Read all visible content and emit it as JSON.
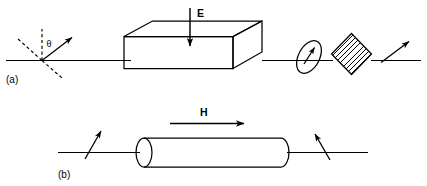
{
  "figure": {
    "width": 427,
    "height": 186,
    "background_color": "#ffffff",
    "line_color": "#000000"
  },
  "panels": [
    {
      "id": "a",
      "label": "(a)",
      "description": "Electro-optic modulator: polarized beam through rectangular crystal slab with transverse electric field E, then analyzer ellipse and hatched polarizer element",
      "field_label": "E",
      "field_direction": "down",
      "angle_label": "θ",
      "element_shape": "rectangular-slab"
    },
    {
      "id": "b",
      "label": "(b)",
      "description": "Magneto-optic Faraday rotator: beam through cylindrical rod with longitudinal magnetic field H, polarization plane rotated at output",
      "field_label": "H",
      "field_direction": "right",
      "element_shape": "cylindrical-rod"
    }
  ],
  "labels": {
    "panel_a": "(a)",
    "panel_b": "(b)",
    "electric_field": "E",
    "magnetic_field": "H",
    "theta": "θ"
  },
  "colors": {
    "stroke": "#000000",
    "background": "#ffffff"
  }
}
